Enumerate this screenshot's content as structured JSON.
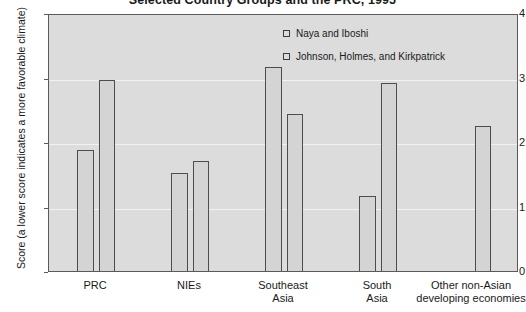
{
  "chart_data": {
    "type": "bar",
    "title": "Selected Country Groups and the PRC, 1995",
    "xlabel": "",
    "ylabel": "Score (a lower score indicates a more favorable climate)",
    "ylim": [
      0,
      4
    ],
    "yticks": [
      "0",
      "1",
      "2",
      "3",
      "4"
    ],
    "grid": true,
    "legend_position": "inside-top-right",
    "categories": [
      "PRC",
      "NIEs",
      "Southeast Asia",
      "South Asia",
      "Other non-Asian developing economies"
    ],
    "category_lines": [
      [
        "PRC"
      ],
      [
        "NIEs"
      ],
      [
        "Southeast",
        "Asia"
      ],
      [
        "South",
        "Asia"
      ],
      [
        "Other non-Asian",
        "developing economies"
      ]
    ],
    "series": [
      {
        "name": "Naya and Iboshi",
        "values": [
          1.9,
          1.55,
          3.2,
          1.2,
          null
        ]
      },
      {
        "name": "Johnson, Holmes, and Kirkpatrick",
        "values": [
          3.0,
          1.73,
          2.47,
          2.95,
          2.28
        ]
      }
    ]
  },
  "legend": {
    "items": [
      {
        "label": "Naya and Iboshi",
        "swatch": "open-square-icon"
      },
      {
        "label": "Johnson, Holmes, and Kirkpatrick",
        "swatch": "open-square-icon"
      }
    ]
  },
  "colors": {
    "plot_background": "#dcdcdc",
    "bar_fill": "#d4d4d4",
    "bar_border": "#4d4d4d",
    "gridline": "#f2f2f2",
    "text": "#1a1a1a"
  }
}
